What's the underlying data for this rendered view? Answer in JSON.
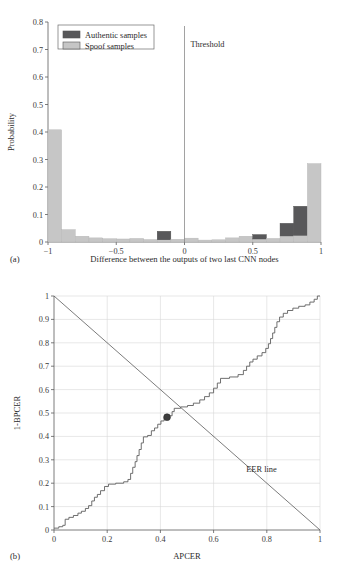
{
  "figure": {
    "background": "#ffffff",
    "panels": [
      {
        "tag": "(a)",
        "type": "histogram"
      },
      {
        "tag": "(b)",
        "type": "roc"
      }
    ]
  },
  "colors": {
    "authentic": "#58585a",
    "spoof": "#c6c6c6",
    "axis": "#5a5a5a",
    "grid": "#d6d6d6",
    "curve": "#5f5f5f",
    "text": "#2b2b2b",
    "threshold": "#8a8a8a"
  },
  "chart_data": [
    {
      "type": "bar",
      "id": "histogram",
      "panel_tag": "(a)",
      "title": "",
      "xlabel": "Difference between the outputs of two last CNN nodes",
      "ylabel": "Probability",
      "xlim": [
        -1,
        1
      ],
      "ylim": [
        0,
        0.8
      ],
      "xticks": [
        -1,
        -0.5,
        0,
        0.5,
        1
      ],
      "xtick_labels": [
        "−1",
        "−0.5",
        "0",
        "0.5",
        "1"
      ],
      "yticks": [
        0,
        0.1,
        0.2,
        0.3,
        0.4,
        0.5,
        0.6,
        0.7,
        0.8
      ],
      "ytick_labels": [
        "0",
        "0.1",
        "0.2",
        "0.3",
        "0.4",
        "0.5",
        "0.6",
        "0.7",
        "0.8"
      ],
      "grid": false,
      "bar_width": 0.1,
      "bin_left_edges": [
        -1.0,
        -0.9,
        -0.8,
        -0.7,
        -0.6,
        -0.5,
        -0.4,
        -0.3,
        -0.2,
        -0.1,
        0.0,
        0.1,
        0.2,
        0.3,
        0.4,
        0.5,
        0.6,
        0.7,
        0.8,
        0.9
      ],
      "series": [
        {
          "name": "Spoof samples",
          "color": "#c6c6c6",
          "values": [
            0.408,
            0.045,
            0.021,
            0.015,
            0.012,
            0.011,
            0.013,
            0.009,
            0.008,
            0.01,
            0.014,
            0.007,
            0.008,
            0.015,
            0.021,
            0.011,
            0.013,
            0.022,
            0.024,
            0.285
          ]
        },
        {
          "name": "Authentic samples",
          "color": "#58585a",
          "values": [
            0.0,
            0.0,
            0.0,
            0.0,
            0.0,
            0.0,
            0.0,
            0.0,
            0.031,
            0.0,
            0.0,
            0.0,
            0.0,
            0.0,
            0.0,
            0.016,
            0.0,
            0.046,
            0.106,
            0.0
          ]
        }
      ],
      "annotations": [
        {
          "name": "threshold",
          "label": "Threshold",
          "x": 0.0,
          "line": true
        }
      ],
      "legend": {
        "position": "upper-left",
        "entries": [
          {
            "label": "Authentic samples",
            "color": "#58585a"
          },
          {
            "label": "Spoof samples",
            "color": "#c6c6c6"
          }
        ]
      }
    },
    {
      "type": "line",
      "id": "roc",
      "panel_tag": "(b)",
      "title": "",
      "xlabel": "APCER",
      "ylabel": "1-BPCER",
      "xlim": [
        0,
        1
      ],
      "ylim": [
        0,
        1
      ],
      "xticks": [
        0,
        0.2,
        0.4,
        0.6,
        0.8,
        1
      ],
      "xtick_labels": [
        "0",
        "0.2",
        "0.4",
        "0.6",
        "0.8",
        "1"
      ],
      "yticks": [
        0,
        0.1,
        0.2,
        0.3,
        0.4,
        0.5,
        0.6,
        0.7,
        0.8,
        0.9,
        1
      ],
      "ytick_labels": [
        "0",
        "0.1",
        "0.2",
        "0.3",
        "0.4",
        "0.5",
        "0.6",
        "0.7",
        "0.8",
        "0.9",
        "1"
      ],
      "grid": true,
      "legend": {
        "position": "none",
        "entries": []
      },
      "annotations": [
        {
          "name": "eer-line-label",
          "label": "EER line",
          "x": 0.78,
          "y": 0.25
        },
        {
          "name": "eer-point",
          "x": 0.425,
          "y": 0.482
        }
      ],
      "series": [
        {
          "name": "ROC curve",
          "color": "#5f5f5f",
          "points": [
            [
              0.0,
              0.008
            ],
            [
              0.018,
              0.008
            ],
            [
              0.018,
              0.014
            ],
            [
              0.033,
              0.014
            ],
            [
              0.033,
              0.02
            ],
            [
              0.042,
              0.02
            ],
            [
              0.042,
              0.046
            ],
            [
              0.056,
              0.046
            ],
            [
              0.056,
              0.054
            ],
            [
              0.073,
              0.054
            ],
            [
              0.073,
              0.062
            ],
            [
              0.09,
              0.062
            ],
            [
              0.09,
              0.072
            ],
            [
              0.103,
              0.072
            ],
            [
              0.103,
              0.08
            ],
            [
              0.118,
              0.08
            ],
            [
              0.118,
              0.092
            ],
            [
              0.13,
              0.092
            ],
            [
              0.13,
              0.104
            ],
            [
              0.142,
              0.104
            ],
            [
              0.142,
              0.124
            ],
            [
              0.152,
              0.124
            ],
            [
              0.152,
              0.14
            ],
            [
              0.163,
              0.14
            ],
            [
              0.163,
              0.152
            ],
            [
              0.175,
              0.152
            ],
            [
              0.175,
              0.168
            ],
            [
              0.19,
              0.168
            ],
            [
              0.19,
              0.186
            ],
            [
              0.205,
              0.186
            ],
            [
              0.205,
              0.196
            ],
            [
              0.232,
              0.196
            ],
            [
              0.232,
              0.2
            ],
            [
              0.262,
              0.2
            ],
            [
              0.262,
              0.206
            ],
            [
              0.278,
              0.206
            ],
            [
              0.278,
              0.216
            ],
            [
              0.288,
              0.216
            ],
            [
              0.288,
              0.242
            ],
            [
              0.296,
              0.242
            ],
            [
              0.296,
              0.268
            ],
            [
              0.305,
              0.268
            ],
            [
              0.305,
              0.292
            ],
            [
              0.312,
              0.292
            ],
            [
              0.312,
              0.318
            ],
            [
              0.32,
              0.318
            ],
            [
              0.32,
              0.344
            ],
            [
              0.328,
              0.344
            ],
            [
              0.328,
              0.372
            ],
            [
              0.336,
              0.372
            ],
            [
              0.336,
              0.398
            ],
            [
              0.352,
              0.398
            ],
            [
              0.352,
              0.404
            ],
            [
              0.366,
              0.404
            ],
            [
              0.366,
              0.424
            ],
            [
              0.378,
              0.424
            ],
            [
              0.378,
              0.436
            ],
            [
              0.39,
              0.436
            ],
            [
              0.39,
              0.452
            ],
            [
              0.402,
              0.452
            ],
            [
              0.402,
              0.466
            ],
            [
              0.414,
              0.466
            ],
            [
              0.414,
              0.478
            ],
            [
              0.428,
              0.478
            ],
            [
              0.428,
              0.488
            ],
            [
              0.444,
              0.488
            ],
            [
              0.444,
              0.506
            ],
            [
              0.452,
              0.506
            ],
            [
              0.452,
              0.52
            ],
            [
              0.476,
              0.52
            ],
            [
              0.476,
              0.526
            ],
            [
              0.502,
              0.526
            ],
            [
              0.502,
              0.532
            ],
            [
              0.524,
              0.532
            ],
            [
              0.524,
              0.542
            ],
            [
              0.548,
              0.542
            ],
            [
              0.548,
              0.556
            ],
            [
              0.566,
              0.556
            ],
            [
              0.566,
              0.57
            ],
            [
              0.584,
              0.57
            ],
            [
              0.584,
              0.586
            ],
            [
              0.6,
              0.586
            ],
            [
              0.6,
              0.606
            ],
            [
              0.614,
              0.606
            ],
            [
              0.614,
              0.628
            ],
            [
              0.626,
              0.628
            ],
            [
              0.626,
              0.648
            ],
            [
              0.66,
              0.648
            ],
            [
              0.66,
              0.654
            ],
            [
              0.692,
              0.654
            ],
            [
              0.692,
              0.664
            ],
            [
              0.712,
              0.664
            ],
            [
              0.712,
              0.682
            ],
            [
              0.724,
              0.682
            ],
            [
              0.724,
              0.7
            ],
            [
              0.736,
              0.7
            ],
            [
              0.736,
              0.718
            ],
            [
              0.748,
              0.718
            ],
            [
              0.748,
              0.73
            ],
            [
              0.764,
              0.73
            ],
            [
              0.764,
              0.744
            ],
            [
              0.782,
              0.744
            ],
            [
              0.782,
              0.758
            ],
            [
              0.796,
              0.758
            ],
            [
              0.796,
              0.776
            ],
            [
              0.806,
              0.776
            ],
            [
              0.806,
              0.796
            ],
            [
              0.814,
              0.796
            ],
            [
              0.814,
              0.818
            ],
            [
              0.822,
              0.818
            ],
            [
              0.822,
              0.842
            ],
            [
              0.83,
              0.842
            ],
            [
              0.83,
              0.866
            ],
            [
              0.838,
              0.866
            ],
            [
              0.838,
              0.89
            ],
            [
              0.848,
              0.89
            ],
            [
              0.848,
              0.91
            ],
            [
              0.862,
              0.91
            ],
            [
              0.862,
              0.926
            ],
            [
              0.878,
              0.926
            ],
            [
              0.878,
              0.938
            ],
            [
              0.898,
              0.938
            ],
            [
              0.898,
              0.948
            ],
            [
              0.92,
              0.948
            ],
            [
              0.92,
              0.956
            ],
            [
              0.944,
              0.956
            ],
            [
              0.944,
              0.962
            ],
            [
              0.962,
              0.962
            ],
            [
              0.962,
              0.974
            ],
            [
              0.978,
              0.974
            ],
            [
              0.978,
              0.986
            ],
            [
              0.99,
              0.986
            ],
            [
              0.99,
              1.0
            ],
            [
              1.0,
              1.0
            ]
          ]
        },
        {
          "name": "EER line",
          "color": "#5a5a5a",
          "points": [
            [
              0.0,
              1.0
            ],
            [
              1.0,
              0.0
            ]
          ]
        }
      ]
    }
  ]
}
